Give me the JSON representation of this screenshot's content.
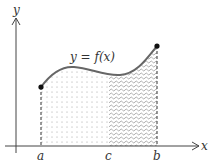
{
  "diagram": {
    "type": "area-under-curve",
    "curve_label": "y = f(x)",
    "axes": {
      "x_label": "x",
      "y_label": "y"
    },
    "points": {
      "a": "a",
      "c": "c",
      "b": "b"
    },
    "regions": [
      {
        "name": "left-region",
        "from": "a",
        "to": "c",
        "pattern": "dotted"
      },
      {
        "name": "right-region",
        "from": "c",
        "to": "b",
        "pattern": "wavy"
      }
    ],
    "colors": {
      "curve": "#666666",
      "axis": "#444444",
      "dots": "#111111",
      "pattern": "#999999"
    }
  }
}
